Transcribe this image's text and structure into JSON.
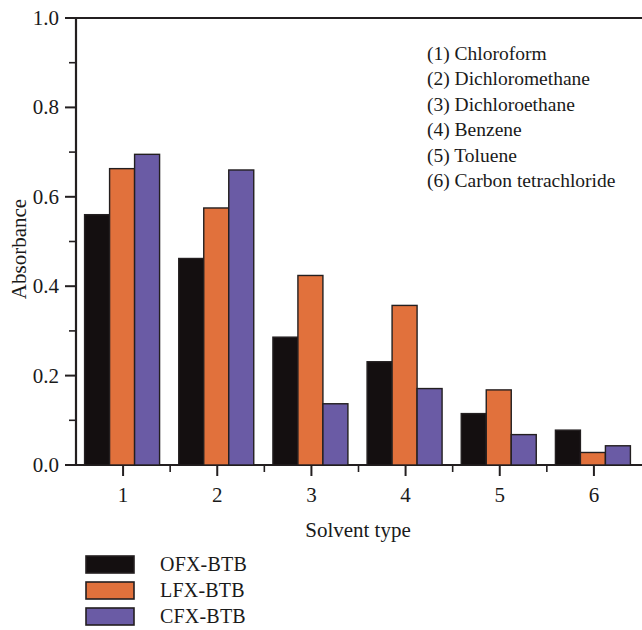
{
  "chart_data": {
    "type": "bar",
    "title": "",
    "xlabel": "Solvent type",
    "ylabel": "Absorbance",
    "categories": [
      "1",
      "2",
      "3",
      "4",
      "5",
      "6"
    ],
    "xlim": [
      0.5,
      6.5
    ],
    "ylim": [
      0.0,
      1.0
    ],
    "ytick_labels": [
      "0.0",
      "0.2",
      "0.4",
      "0.6",
      "0.8",
      "1.0"
    ],
    "ytick_values": [
      0.0,
      0.2,
      0.4,
      0.6,
      0.8,
      1.0
    ],
    "yminor_values": [
      0.1,
      0.3,
      0.5,
      0.7,
      0.9
    ],
    "grid": false,
    "legend_position": "below-left",
    "series": [
      {
        "name": "OFX-BTB",
        "color": "#140f10",
        "values": [
          0.56,
          0.462,
          0.286,
          0.231,
          0.115,
          0.078
        ]
      },
      {
        "name": "LFX-BTB",
        "color": "#e1713c",
        "values": [
          0.663,
          0.575,
          0.424,
          0.357,
          0.168,
          0.028
        ]
      },
      {
        "name": "CFX-BTB",
        "color": "#6a5ba5",
        "values": [
          0.695,
          0.66,
          0.137,
          0.171,
          0.068,
          0.043
        ]
      }
    ],
    "annotations": [
      "(1) Chloroform",
      "(2) Dichloromethane",
      "(3) Dichloroethane",
      "(4) Benzene",
      "(5) Toluene",
      "(6) Carbon tetrachloride"
    ]
  }
}
